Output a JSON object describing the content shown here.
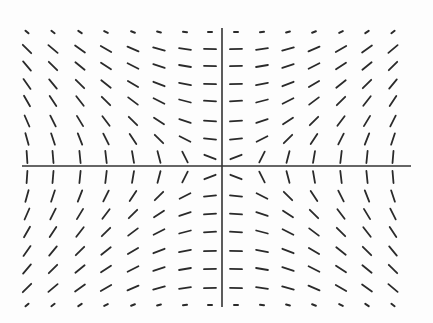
{
  "diagram": {
    "type": "slope_field",
    "colors": {
      "background": "#fdfdfd",
      "segment": "#2a2a2a",
      "axis": "#333333"
    },
    "axes": {
      "x_axis": {
        "y": 166,
        "x_start": 22,
        "x_end": 411
      },
      "y_axis": {
        "x": 222,
        "y_start": 28,
        "y_end": 307
      }
    },
    "grid": {
      "columns_x": [
        27,
        53,
        80,
        106,
        133,
        159,
        185,
        210,
        236,
        262,
        288,
        314,
        341,
        367,
        393
      ],
      "column_values": [
        -7,
        -6,
        -5,
        -4,
        -3,
        -2,
        -1,
        -0.2,
        0.2,
        1,
        2,
        3,
        4,
        5,
        6
      ],
      "rows_y": [
        32,
        49,
        66,
        84,
        101,
        121,
        139,
        157,
        177,
        196,
        214,
        232,
        251,
        269,
        288,
        305
      ],
      "row_values": [
        8,
        7,
        6,
        5,
        4,
        3,
        2,
        0.5,
        -0.5,
        -2,
        -3,
        -4,
        -5,
        -6,
        -7,
        -8
      ],
      "segment_half_length": 6,
      "short_rows": [
        0,
        15
      ],
      "short_half_length": 2
    },
    "slope_rule": "x / y"
  }
}
